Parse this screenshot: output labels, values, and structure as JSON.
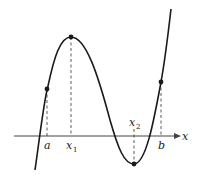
{
  "figure": {
    "axis": {
      "label": "x",
      "color": "#444444"
    },
    "curve_color": "#1a1a1a",
    "labels": {
      "a": "a",
      "x1_main": "x",
      "x1_sub": "1",
      "x2_main": "x",
      "x2_sub": "2",
      "b": "b",
      "axis_x": "x"
    },
    "points": [
      {
        "name": "a",
        "role": "left endpoint"
      },
      {
        "name": "x1",
        "role": "local maximum"
      },
      {
        "name": "x2",
        "role": "local minimum"
      },
      {
        "name": "b",
        "role": "right endpoint"
      }
    ]
  }
}
